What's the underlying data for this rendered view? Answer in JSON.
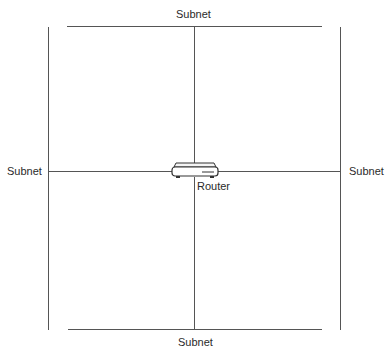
{
  "diagram": {
    "title": "",
    "nodes": [
      {
        "id": "router",
        "label": "Router",
        "type": "router"
      },
      {
        "id": "subnet-top",
        "label": "Subnet",
        "type": "network-segment"
      },
      {
        "id": "subnet-bottom",
        "label": "Subnet",
        "type": "network-segment"
      },
      {
        "id": "subnet-left",
        "label": "Subnet",
        "type": "network-segment"
      },
      {
        "id": "subnet-right",
        "label": "Subnet",
        "type": "network-segment"
      }
    ],
    "edges": [
      {
        "from": "router",
        "to": "subnet-top"
      },
      {
        "from": "router",
        "to": "subnet-bottom"
      },
      {
        "from": "router",
        "to": "subnet-left"
      },
      {
        "from": "router",
        "to": "subnet-right"
      }
    ]
  },
  "labels": {
    "top": "Subnet",
    "bottom": "Subnet",
    "left": "Subnet",
    "right": "Subnet",
    "router": "Router"
  },
  "icons": {
    "router": "router-icon"
  },
  "colors": {
    "line": "#555555",
    "text": "#2a2a2a",
    "background": "#ffffff"
  }
}
